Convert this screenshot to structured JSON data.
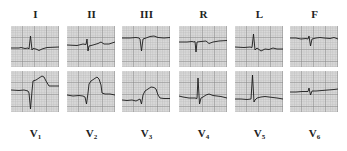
{
  "figure": {
    "grid_color": "#a8a8a8",
    "grid_major_color": "#8a8a8a",
    "paper_color": "#d9d9d9",
    "trace_color": "#1a1a1a",
    "top_row": [
      {
        "lead": "I",
        "sub": "",
        "x": 11
      },
      {
        "lead": "II",
        "sub": "",
        "x": 67
      },
      {
        "lead": "III",
        "sub": "",
        "x": 122
      },
      {
        "lead": "R",
        "sub": "",
        "x": 179
      },
      {
        "lead": "L",
        "sub": "",
        "x": 235
      },
      {
        "lead": "F",
        "sub": "",
        "x": 290
      }
    ],
    "bottom_row": [
      {
        "lead": "V",
        "sub": "1",
        "x": 11
      },
      {
        "lead": "V",
        "sub": "2",
        "x": 67
      },
      {
        "lead": "V",
        "sub": "3",
        "x": 122
      },
      {
        "lead": "V",
        "sub": "4",
        "x": 179
      },
      {
        "lead": "V",
        "sub": "5",
        "x": 235
      },
      {
        "lead": "V",
        "sub": "6",
        "x": 290
      }
    ]
  }
}
